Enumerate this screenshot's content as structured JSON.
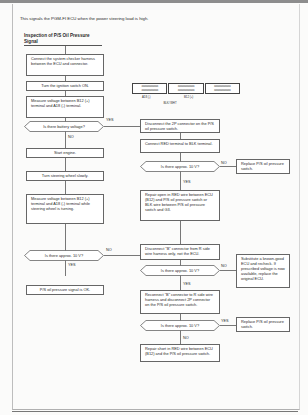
{
  "intro": "This signals the PGM-FI ECU when the power steering load is high.",
  "heading": "Inspection of P/S Oil Pressure Signal",
  "connector": {
    "rows": [
      "ooooooooooo",
      "ooooooooooo"
    ],
    "pin_left": "A18 (-)",
    "pin_right": "B12 (+)",
    "wire_label": "BLK/ WHT"
  },
  "left_flow": {
    "step1": "Connect the system checker harness between the ECU and connector.",
    "step2": "Turn the ignition switch ON.",
    "step3": "Measure voltage between B12 (+) terminal and A18 (-) terminal.",
    "decision1": "Is there battery voltage?",
    "decision1_yes": "YES",
    "decision1_no": "NO",
    "step4": "Start engine.",
    "step5": "Turn steering wheel slowly.",
    "step6": "Measure voltage between B12 (+) terminal and A18 (-) terminal while steering wheel is turning.",
    "decision2": "Is there approx. 10 V?",
    "decision2_no": "NO",
    "decision2_yes": "YES",
    "result_ok": "P/S oil pressure signal is OK."
  },
  "right_flow": {
    "step1": "Disconnect the 2P connector on the P/S oil pressure switch.",
    "step2": "Connect RED terminal to BLK terminal.",
    "decision1": "Is there approx. 10 V?",
    "decision1_no": "NO",
    "decision1_yes": "YES",
    "replace1": "Replace P/S oil pressure switch.",
    "repair1": "Repair open in RED wire between ECU (B12) and P/S oil pressure switch or BLK wire between P/S oil pressure switch and G3.",
    "step3": "Disconnect \"B\" connector from R side wire harness only, not the ECU.",
    "decision2": "Is there approx. 10 V?",
    "decision2_no": "NO",
    "decision2_yes": "YES",
    "substitute": "Substitute a known-good ECU and recheck. If prescribed voltage is now available, replace the original ECU.",
    "step4": "Reconnect \"B\" connector to R side wire harness and disconnect 2P connector on the P/S oil pressure switch.",
    "decision3": "Is there approx. 10 V?",
    "decision3_yes": "YES",
    "decision3_no": "NO",
    "replace2": "Replace P/S oil pressure switch.",
    "repair2": "Repair short in RED wire between ECU (B12) and the P/S oil pressure switch."
  }
}
